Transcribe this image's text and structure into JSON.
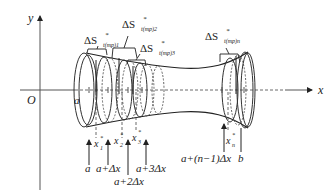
{
  "axes": {
    "x_label": "x",
    "y_label": "y",
    "origin_label": "O"
  },
  "surface_labels": [
    {
      "delta": "ΔS",
      "sup": "*",
      "sub": "t(mp)1"
    },
    {
      "delta": "ΔS",
      "sup": "*",
      "sub": "t(mp)2"
    },
    {
      "delta": "ΔS",
      "sup": "*",
      "sub": "t(mp)3"
    },
    {
      "delta": "ΔS",
      "sup": "*",
      "sub": "t(mp)n"
    }
  ],
  "sample_points": [
    {
      "base": "x",
      "sup": "*",
      "sub": "1"
    },
    {
      "base": "x",
      "sup": "*",
      "sub": "2"
    },
    {
      "base": "x",
      "sup": "*",
      "sub": "3"
    },
    {
      "base": "x",
      "sup": "*",
      "sub": "n"
    }
  ],
  "partition_labels": {
    "a": "a",
    "a1": "a+Δx",
    "a2": "a+2Δx",
    "a3": "a+3Δx",
    "an": "a+(n−1)Δx",
    "b": "b",
    "a_axis": "a"
  },
  "colors": {
    "line": "#222222",
    "background": "#ffffff"
  }
}
